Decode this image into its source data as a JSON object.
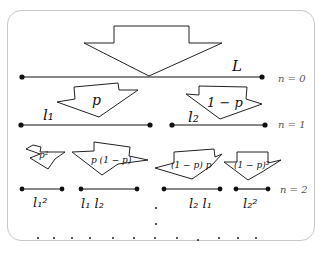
{
  "levels": [
    {
      "label": "n = 0",
      "segments": [
        {
          "label": "L"
        }
      ]
    },
    {
      "label": "n = 1",
      "segments": [
        {
          "label": "l₁"
        },
        {
          "label": "l₂"
        }
      ],
      "arrows": [
        {
          "label": "p"
        },
        {
          "label": "1 − p"
        }
      ]
    },
    {
      "label": "n = 2",
      "segments": [
        {
          "label": "l₁²"
        },
        {
          "label": "l₁ l₂"
        },
        {
          "label": "l₂ l₁"
        },
        {
          "label": "l₂²"
        }
      ],
      "arrows": [
        {
          "label": "p²"
        },
        {
          "label": "p (1 − p)"
        },
        {
          "label": "(1 − p) p"
        },
        {
          "label": "(1 − p)²"
        }
      ]
    }
  ],
  "continuation": "…"
}
